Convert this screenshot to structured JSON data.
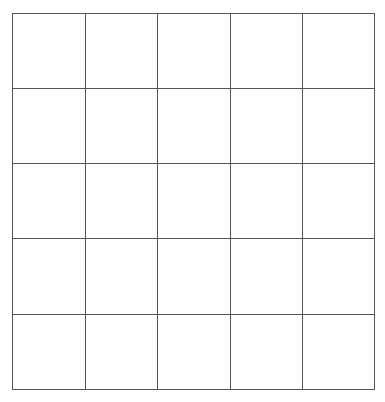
{
  "grid": {
    "rows": 5,
    "cols": 5,
    "x_lines": [
      12,
      85,
      157,
      230,
      302,
      374
    ],
    "y_lines": [
      13,
      88,
      163,
      238,
      314,
      389
    ],
    "line_color": "#555555",
    "background": "#ffffff"
  }
}
